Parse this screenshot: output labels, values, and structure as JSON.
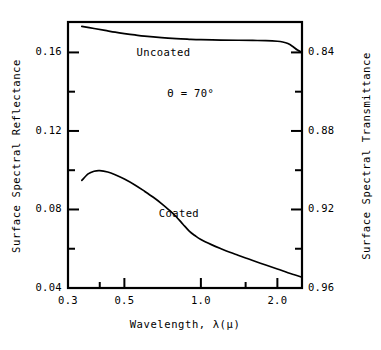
{
  "chart_data": {
    "type": "line",
    "title": "",
    "xlabel": "Wavelength, λ(μ)",
    "ylabel": "Surface Spectral Reflectance",
    "y2label": "Surface Spectral Transmittance",
    "xscale": "log",
    "xlim": [
      0.3,
      2.5
    ],
    "ylim": [
      0.04,
      0.1755
    ],
    "y2lim": [
      0.96,
      0.8245
    ],
    "grid": false,
    "legend": "inline-curve-labels",
    "xticks": [
      0.3,
      0.5,
      1.0,
      2.0
    ],
    "xticklabels": [
      "0.3",
      "0.5",
      "1.0",
      "2.0"
    ],
    "xminorticks": [
      0.4,
      1.5
    ],
    "yticks": [
      0.04,
      0.08,
      0.12,
      0.16
    ],
    "yticklabels": [
      "0.04",
      "0.08",
      "0.12",
      "0.16"
    ],
    "yminorticks": [
      0.06,
      0.1,
      0.14
    ],
    "y2ticks": [
      0.84,
      0.88,
      0.92,
      0.96
    ],
    "y2ticklabels": [
      "0.84",
      "0.88",
      "0.92",
      "0.96"
    ],
    "y2minorticks": [
      0.86,
      0.9,
      0.94
    ],
    "annotations": [
      {
        "name": "incidence-angle",
        "text": "Θ = 70°",
        "x": 0.95,
        "y": 0.139
      }
    ],
    "series": [
      {
        "name": "Uncoated",
        "label": "Uncoated",
        "label_x": 0.72,
        "label_y": 0.1595,
        "color": "#000000",
        "points": [
          [
            0.34,
            0.1733
          ],
          [
            0.38,
            0.1722
          ],
          [
            0.42,
            0.1712
          ],
          [
            0.46,
            0.1703
          ],
          [
            0.5,
            0.1696
          ],
          [
            0.55,
            0.1689
          ],
          [
            0.6,
            0.1683
          ],
          [
            0.7,
            0.1675
          ],
          [
            0.8,
            0.167
          ],
          [
            0.9,
            0.1667
          ],
          [
            1.0,
            0.1665
          ],
          [
            1.2,
            0.1663
          ],
          [
            1.4,
            0.1662
          ],
          [
            1.6,
            0.1661
          ],
          [
            1.8,
            0.166
          ],
          [
            2.0,
            0.1657
          ],
          [
            2.1,
            0.1653
          ],
          [
            2.2,
            0.1645
          ],
          [
            2.3,
            0.163
          ],
          [
            2.4,
            0.1612
          ],
          [
            2.5,
            0.16
          ]
        ]
      },
      {
        "name": "Coated",
        "label": "Coated",
        "label_x": 0.88,
        "label_y": 0.0775,
        "color": "#000000",
        "points": [
          [
            0.34,
            0.0948
          ],
          [
            0.36,
            0.0981
          ],
          [
            0.38,
            0.0995
          ],
          [
            0.4,
            0.0998
          ],
          [
            0.43,
            0.0991
          ],
          [
            0.46,
            0.0977
          ],
          [
            0.5,
            0.0955
          ],
          [
            0.55,
            0.0925
          ],
          [
            0.6,
            0.0893
          ],
          [
            0.65,
            0.0862
          ],
          [
            0.7,
            0.083
          ],
          [
            0.75,
            0.0797
          ],
          [
            0.8,
            0.0763
          ],
          [
            0.85,
            0.0725
          ],
          [
            0.9,
            0.069
          ],
          [
            0.95,
            0.0666
          ],
          [
            1.0,
            0.0647
          ],
          [
            1.1,
            0.0621
          ],
          [
            1.2,
            0.06
          ],
          [
            1.3,
            0.0582
          ],
          [
            1.4,
            0.0567
          ],
          [
            1.5,
            0.0553
          ],
          [
            1.6,
            0.054
          ],
          [
            1.8,
            0.0517
          ],
          [
            2.0,
            0.0497
          ],
          [
            2.2,
            0.0478
          ],
          [
            2.35,
            0.0466
          ],
          [
            2.5,
            0.0455
          ]
        ]
      }
    ]
  }
}
